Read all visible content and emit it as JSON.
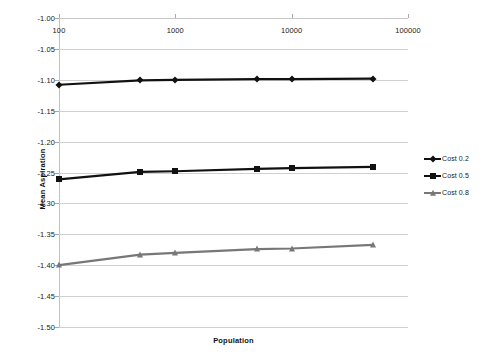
{
  "chart_data": {
    "type": "line",
    "title": "",
    "xlabel": "Population",
    "ylabel": "Mean Aspiration",
    "xscale": "log",
    "xlim": [
      100,
      100000
    ],
    "ylim": [
      -1.5,
      -1.0
    ],
    "grid": true,
    "legend_position": "right",
    "xticks": [
      {
        "value": 100,
        "label": "100"
      },
      {
        "value": 1000,
        "label": "1000"
      },
      {
        "value": 10000,
        "label": "10000"
      },
      {
        "value": 100000,
        "label": "100000"
      }
    ],
    "yticks": [
      {
        "value": -1.0,
        "label": "-1.00"
      },
      {
        "value": -1.05,
        "label": "-1.05"
      },
      {
        "value": -1.1,
        "label": "-1.10"
      },
      {
        "value": -1.15,
        "label": "-1.15"
      },
      {
        "value": -1.2,
        "label": "-1.20"
      },
      {
        "value": -1.25,
        "label": "-1.25"
      },
      {
        "value": -1.3,
        "label": "-1.30"
      },
      {
        "value": -1.35,
        "label": "-1.35"
      },
      {
        "value": -1.4,
        "label": "-1.40"
      },
      {
        "value": -1.45,
        "label": "-1.45"
      },
      {
        "value": -1.5,
        "label": "-1.50"
      }
    ],
    "x": [
      100,
      500,
      1000,
      5000,
      10000,
      50000
    ],
    "series": [
      {
        "name": "Cost 0.2",
        "marker": "diamond",
        "color": "#111111",
        "values": [
          -1.108,
          -1.101,
          -1.1,
          -1.099,
          -1.099,
          -1.098
        ]
      },
      {
        "name": "Cost 0.5",
        "marker": "square",
        "color": "#111111",
        "values": [
          -1.261,
          -1.249,
          -1.248,
          -1.244,
          -1.243,
          -1.241
        ]
      },
      {
        "name": "Cost 0.8",
        "marker": "triangle",
        "color": "#777777",
        "values": [
          -1.4,
          -1.383,
          -1.38,
          -1.374,
          -1.373,
          -1.367
        ]
      }
    ]
  },
  "legend": {
    "items": [
      {
        "label": "Cost 0.2"
      },
      {
        "label": "Cost 0.5"
      },
      {
        "label": "Cost 0.8"
      }
    ]
  },
  "axes": {
    "x_title": "Population",
    "y_title": "Mean Aspiration"
  }
}
